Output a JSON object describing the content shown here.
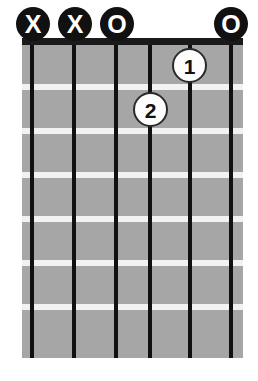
{
  "diagram": {
    "type": "guitar-chord-diagram",
    "instrument": "guitar",
    "string_count": 6,
    "fret_count": 7,
    "starting_fret": 1,
    "colors": {
      "fretboard": "#a6a6a6",
      "fret_line": "#f2f2f2",
      "string": "#111111",
      "nut": "#1a1a1a",
      "marker_fill": "#111111",
      "marker_text": "#ffffff",
      "dot_fill": "#fdfdfd",
      "dot_border": "#2a2a2a",
      "dot_text": "#111111",
      "background": "#ffffff"
    },
    "top_markers": [
      {
        "string": 1,
        "symbol": "X",
        "meaning": "muted",
        "x": 33
      },
      {
        "string": 2,
        "symbol": "X",
        "meaning": "muted",
        "x": 75
      },
      {
        "string": 3,
        "symbol": "O",
        "meaning": "open",
        "x": 117
      },
      {
        "string": 6,
        "symbol": "O",
        "meaning": "open",
        "x": 231
      }
    ],
    "finger_dots": [
      {
        "label": "1",
        "string": 5,
        "fret": 1,
        "x": 190,
        "y": 66
      },
      {
        "label": "2",
        "string": 4,
        "fret": 2,
        "x": 151,
        "y": 110
      }
    ],
    "strings_x": [
      32,
      74,
      116,
      150,
      190,
      231
    ],
    "fret_lines_y": [
      88,
      132,
      176,
      220,
      264,
      308
    ]
  }
}
